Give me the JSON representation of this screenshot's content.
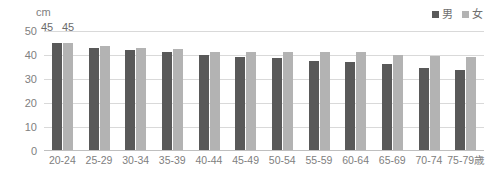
{
  "unit_label": "cm",
  "legend": {
    "position": "top-right",
    "items": [
      {
        "label": "男",
        "color": "#595959",
        "name": "male"
      },
      {
        "label": "女",
        "color": "#b3b3b3",
        "name": "female"
      }
    ]
  },
  "axis": {
    "yticks": [
      "50",
      "40",
      "30",
      "20",
      "10",
      "0"
    ],
    "ylim": [
      0,
      50
    ]
  },
  "data_labels": [
    {
      "text": "45",
      "series": "male",
      "category": "20-24"
    },
    {
      "text": "45",
      "series": "female",
      "category": "20-24"
    }
  ],
  "chart_data": {
    "type": "bar",
    "title": "",
    "xlabel": "",
    "ylabel": "cm",
    "ylim": [
      0,
      50
    ],
    "yticks": [
      0,
      10,
      20,
      30,
      40,
      50
    ],
    "grid": true,
    "legend_position": "top-right",
    "categories": [
      "20-24",
      "25-29",
      "30-34",
      "35-39",
      "40-44",
      "45-49",
      "50-54",
      "55-59",
      "60-64",
      "65-69",
      "70-74",
      "75-79歳"
    ],
    "series": [
      {
        "name": "男",
        "color": "#595959",
        "values": [
          45,
          43,
          42,
          41,
          40,
          39,
          38.5,
          37.5,
          37,
          36,
          34.5,
          33.5
        ]
      },
      {
        "name": "女",
        "color": "#b3b3b3",
        "values": [
          45,
          43.5,
          43,
          42.5,
          41,
          41,
          41,
          41,
          41,
          40,
          39.5,
          39
        ]
      }
    ],
    "annotations": [
      "45",
      "45"
    ]
  }
}
